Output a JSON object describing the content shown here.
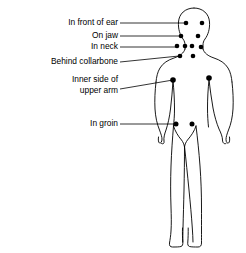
{
  "diagram": {
    "stroke_color": "#000000",
    "background_color": "#ffffff",
    "dot_color": "#000000",
    "labels": [
      {
        "id": "in-front-of-ear",
        "lines": [
          "In front of ear"
        ],
        "text_anchor_x": 118,
        "text_y": 23,
        "leader": {
          "x1": 120,
          "y1": 23,
          "x2": 185,
          "y2": 23
        }
      },
      {
        "id": "on-jaw",
        "lines": [
          "On jaw"
        ],
        "text_anchor_x": 118,
        "text_y": 36,
        "leader": {
          "x1": 120,
          "y1": 36,
          "x2": 180,
          "y2": 36
        }
      },
      {
        "id": "in-neck",
        "lines": [
          "In neck"
        ],
        "text_anchor_x": 118,
        "text_y": 47,
        "leader": {
          "x1": 120,
          "y1": 47,
          "x2": 176,
          "y2": 47
        }
      },
      {
        "id": "behind-collarbone",
        "lines": [
          "Behind collarbone"
        ],
        "text_anchor_x": 118,
        "text_y": 62,
        "leader": {
          "x1": 120,
          "y1": 62,
          "x2": 179,
          "y2": 56
        }
      },
      {
        "id": "inner-side-of-upper-arm",
        "lines": [
          "Inner side of",
          "upper arm"
        ],
        "text_anchor_x": 118,
        "text_y": 80,
        "leader": {
          "x1": 120,
          "y1": 89,
          "x2": 173,
          "y2": 80
        }
      },
      {
        "id": "in-groin",
        "lines": [
          "In groin"
        ],
        "text_anchor_x": 118,
        "text_y": 124,
        "leader": {
          "x1": 120,
          "y1": 124,
          "x2": 175,
          "y2": 124
        }
      }
    ],
    "nodes": [
      {
        "id": "node-ear-left",
        "group": "in-front-of-ear",
        "cx": 186,
        "cy": 23,
        "r": 2.3
      },
      {
        "id": "node-ear-right",
        "group": "in-front-of-ear",
        "cx": 202,
        "cy": 23,
        "r": 2.3
      },
      {
        "id": "node-jaw-left",
        "group": "on-jaw",
        "cx": 181,
        "cy": 36,
        "r": 2.3
      },
      {
        "id": "node-jaw-right",
        "group": "on-jaw",
        "cx": 198,
        "cy": 36,
        "r": 2.3
      },
      {
        "id": "node-neck-1",
        "group": "in-neck",
        "cx": 177,
        "cy": 46,
        "r": 2.3
      },
      {
        "id": "node-neck-2",
        "group": "in-neck",
        "cx": 185,
        "cy": 46,
        "r": 2.3
      },
      {
        "id": "node-neck-3",
        "group": "in-neck",
        "cx": 192,
        "cy": 46,
        "r": 2.3
      },
      {
        "id": "node-neck-4",
        "group": "in-neck",
        "cx": 201,
        "cy": 47,
        "r": 2.3
      },
      {
        "id": "node-collarbone-left",
        "group": "behind-collarbone",
        "cx": 180,
        "cy": 56,
        "r": 2.3
      },
      {
        "id": "node-collarbone-right",
        "group": "behind-collarbone",
        "cx": 193,
        "cy": 56,
        "r": 2.3
      },
      {
        "id": "node-arm-left",
        "group": "inner-side-of-upper-arm",
        "cx": 173,
        "cy": 80,
        "r": 2.8
      },
      {
        "id": "node-arm-right",
        "group": "inner-side-of-upper-arm",
        "cx": 209,
        "cy": 78,
        "r": 2.8
      },
      {
        "id": "node-groin-left",
        "group": "in-groin",
        "cx": 176,
        "cy": 124,
        "r": 2.5
      },
      {
        "id": "node-groin-right",
        "group": "in-groin",
        "cx": 192,
        "cy": 124,
        "r": 2.5
      }
    ]
  }
}
